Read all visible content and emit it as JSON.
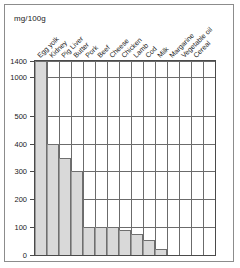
{
  "figure": {
    "unit_label": "mg/100g",
    "background": "#ffffff",
    "border_color": "#8c8c8c",
    "bar_fill": "#d9d9d9",
    "bar_edge": "#6f6f6f",
    "grid_color": "#6b6b6b"
  },
  "chart_data": {
    "type": "bar",
    "title": "",
    "subtitle": "",
    "xlabel": "",
    "ylabel": "mg/100g",
    "ylim": [
      0,
      1400
    ],
    "grid": true,
    "legend": "none",
    "axis_note": "broken y-axis: linear 0-500, compressed above 500",
    "ytick_labels": [
      "0",
      "100",
      "200",
      "300",
      "400",
      "500",
      "1000",
      "1400"
    ],
    "ytick_values": [
      0,
      100,
      200,
      300,
      400,
      500,
      1000,
      1400
    ],
    "categories": [
      "Egg yolk",
      "Kidney",
      "Pig Liver",
      "Butter",
      "Pork",
      "Beef",
      "Cheese",
      "Chicken",
      "Lamb",
      "Cod",
      "Milk",
      "Margarine",
      "Vegetable oil",
      "Cereal"
    ],
    "values": [
      1400,
      400,
      350,
      300,
      100,
      100,
      100,
      90,
      75,
      55,
      20,
      0,
      0,
      0
    ]
  }
}
